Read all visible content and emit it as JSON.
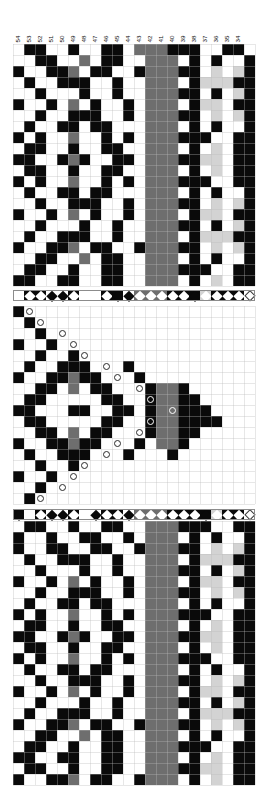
{
  "document": {
    "kind": "weaving-draft",
    "title": "Weaving draft — threading, treadling and drawdown"
  },
  "layout": {
    "cell_px": 11,
    "grid_left_px": 13,
    "grid_right_px": 256,
    "columns": 22,
    "color_key": {
      "white": "#ffffff",
      "black": "#0a0a0a",
      "grey": "#6e6e6e",
      "light_grey": "#d3d3d3",
      "gridline": "#b9b9b9"
    }
  },
  "column_numbers": {
    "label": "thread numbers",
    "values": [
      "54",
      "53",
      "52",
      "51",
      "50",
      "49",
      "48",
      "47",
      "46",
      "45",
      "44",
      "43",
      "42",
      "41",
      "40",
      "39",
      "38",
      "37",
      "36",
      "35",
      "34"
    ]
  },
  "top_block": {
    "name": "upper-drawdown",
    "top_px": 44,
    "rows": 22,
    "grid": [
      "wkkwwkwwkkwgggkkkwwkk",
      "wwkkwwgwkkwwgggwkwkwwkw",
      "kwwkkgwkkwwkgggkkwlwlkk",
      "wkwwkkkwwkwwgggwklllkkw",
      "wwkwwwkwwkwwgggkkwkwlkk",
      "kwwkwgwkwwkwgggwkllwkkw",
      "wwkwwkkkwwkwgggkkwlwlkk",
      "wkwwkkwkkwwwgggwkwkwwkw",
      "kwkwwgwwkwkwgggkkkwwkkw",
      "wkkwwkwwkkwwgggwkwlwkkw",
      "kkwwkgkwwkkwgggkkllwkkk",
      "wkkwwkwwkkwwgggwkwlwkkw",
      "kwkwwgwwkwkwgggkkkwwkkw",
      "wkwwkkwkkwwwgggwkwkwwkw",
      "wwkwwkkkwwkwgggkkwlwlkk",
      "kwwkwgwkwwkwgggwkllwkkw",
      "wwkwwwkwwkwwgggkkwkwlkk",
      "wkwwkkkwwkwwgggwklllkkw",
      "kwwkkgwkkwwkgggkkwlwlkk",
      "wwkkwwgwkkwwgggwkwkwwkw",
      "wkkwwkwwkkwwgggkkkwwkk",
      "kkwwkkwwkkwwgggwkwlwkkw"
    ]
  },
  "symbol_row_top": {
    "name": "colour-sequence-upper",
    "top_px": 290,
    "cells": [
      {
        "bg": "white",
        "diamond": "white"
      },
      {
        "bg": "black",
        "diamond": "white"
      },
      {
        "bg": "black",
        "diamond": "white"
      },
      {
        "bg": "white",
        "diamond": "black"
      },
      {
        "bg": "white",
        "diamond": "black"
      },
      {
        "bg": "black",
        "diamond": "white"
      },
      {
        "bg": "white",
        "diamond": "white"
      },
      {
        "bg": "white",
        "diamond": "white"
      },
      {
        "bg": "black",
        "diamond": "white"
      },
      {
        "bg": "black",
        "diamond": "black"
      },
      {
        "bg": "white",
        "diamond": "black"
      },
      {
        "bg": "grey",
        "diamond": "white"
      },
      {
        "bg": "grey",
        "diamond": "white"
      },
      {
        "bg": "grey",
        "diamond": "white"
      },
      {
        "bg": "black",
        "diamond": "white"
      },
      {
        "bg": "black",
        "diamond": "white"
      },
      {
        "bg": "black",
        "diamond": "black"
      },
      {
        "bg": "light_grey",
        "diamond": "white"
      },
      {
        "bg": "black",
        "diamond": "white"
      },
      {
        "bg": "black",
        "diamond": "white"
      },
      {
        "bg": "black",
        "diamond": "white"
      },
      {
        "bg": "white",
        "diamond": "outline"
      }
    ]
  },
  "middle_block": {
    "name": "treadling-drawdown",
    "top_px": 306,
    "rows": 18,
    "description": "Chevron of treadling markers; circular symbols step out to the right then back.",
    "grid": [
      "kwwwwwwwwwwwwwwwwwwwww",
      "wkwwwwwwwwwwwwwwwwwwww",
      "wwkwwwwwwwwwwwwwwwwwww",
      "kwwkwwwwwwwwwwwwwwwwww",
      "wwkwwkwwwwwwwwwwwwwwww",
      "wkwwkkkwwwkwwwwwwwwwww",
      "kwwkkgkkwwwkwwwwwwwwww",
      "wwkkwgwkkwwwkggkwwwwww",
      "wkkwwwwwkkwwkggkkwwwww",
      "kkwwwkkwwkkwkggkkkwwww",
      "wkkwwwwwkkwwkggkkkkwww",
      "wwkkwgwkkwwwkggkkwwwww",
      "kwwkkgkkwwwkwggkwwwwww",
      "wkwwkkkwwwkwwwkwwwwwww",
      "wwkwwkwwwwwwwwwwwwwwww",
      "kwwkwwwwwwwwwwwwwwwwww",
      "wwkwwwwwwwwwwwwwwwwwww",
      "wkwwwwwwwwwwwwwwwwwwww"
    ],
    "markers": [
      {
        "row": 0,
        "col": 1
      },
      {
        "row": 1,
        "col": 2
      },
      {
        "row": 2,
        "col": 4
      },
      {
        "row": 3,
        "col": 5
      },
      {
        "row": 4,
        "col": 6
      },
      {
        "row": 5,
        "col": 8
      },
      {
        "row": 6,
        "col": 9
      },
      {
        "row": 7,
        "col": 11
      },
      {
        "row": 8,
        "col": 12
      },
      {
        "row": 9,
        "col": 14
      },
      {
        "row": 10,
        "col": 12
      },
      {
        "row": 11,
        "col": 11
      },
      {
        "row": 12,
        "col": 9
      },
      {
        "row": 13,
        "col": 8
      },
      {
        "row": 14,
        "col": 6
      },
      {
        "row": 15,
        "col": 5
      },
      {
        "row": 16,
        "col": 4
      },
      {
        "row": 17,
        "col": 2
      }
    ]
  },
  "symbol_row_bottom": {
    "name": "colour-sequence-lower",
    "top_px": 509,
    "cells": [
      {
        "bg": "black",
        "diamond": "black"
      },
      {
        "bg": "white",
        "diamond": "white"
      },
      {
        "bg": "black",
        "diamond": "white"
      },
      {
        "bg": "white",
        "diamond": "black"
      },
      {
        "bg": "white",
        "diamond": "black"
      },
      {
        "bg": "black",
        "diamond": "white"
      },
      {
        "bg": "white",
        "diamond": "white"
      },
      {
        "bg": "white",
        "diamond": "black"
      },
      {
        "bg": "black",
        "diamond": "white"
      },
      {
        "bg": "black",
        "diamond": "white"
      },
      {
        "bg": "white",
        "diamond": "black"
      },
      {
        "bg": "grey",
        "diamond": "white"
      },
      {
        "bg": "grey",
        "diamond": "white"
      },
      {
        "bg": "grey",
        "diamond": "white"
      },
      {
        "bg": "black",
        "diamond": "white"
      },
      {
        "bg": "black",
        "diamond": "white"
      },
      {
        "bg": "black",
        "diamond": "white"
      },
      {
        "bg": "black",
        "diamond": "black"
      },
      {
        "bg": "light_grey",
        "diamond": "white"
      },
      {
        "bg": "black",
        "diamond": "white"
      },
      {
        "bg": "black",
        "diamond": "white"
      },
      {
        "bg": "white",
        "diamond": "outline"
      }
    ]
  },
  "bottom_block": {
    "name": "lower-drawdown",
    "top_px": 521,
    "rows": 24,
    "grid": [
      "wkkwwkwwkkwwgggkkkwwkk",
      "kwwkwwkkwwkwgggwkwkwwk",
      "kwwkkwwkkwwkgggkkwlwlk",
      "wkwwkkkwwkwwgggwklllkk",
      "wwkwwwkwwkwwgggkkwkwlk",
      "kwwkwgwkwwkwgggwkllwkk",
      "wwkwwkkkwwkwgggkkwlwlk",
      "wkwwkkwkkwwwgggwkwkwwk",
      "kwkwwgwwkwkwgggkkkwwkk",
      "wkkwwkwwkkwwgggwkwlwkk",
      "kkwwkgkwwkkwgggkkllwkk",
      "wkkwwkwwkkwwgggwkwlwkk",
      "kwkwwgwwkwkwgggkkkwwkk",
      "wkwwkkwkkwwwgggwkwkwwk",
      "wwkwwkkkwwkwgggkkwlwlk",
      "kwwkwgwkwwkwgggwkllwkk",
      "wwkwwwkwwkwwgggkkwkwlk",
      "wkwwkkkwwkwwgggwklllkk",
      "kwwkkgwkkwwkgggkkwlwlk",
      "wwkkwwgwkkwwgggwkwkwwk",
      "wkkwwkwwkkwwgggkkkwwkk",
      "kkwwkkwwkkwwgggwkwlwkk",
      "wkkwwkwwkkwwgggkkllwkk",
      "kwwkkgwkkwwkgggwkwlwkk"
    ]
  }
}
